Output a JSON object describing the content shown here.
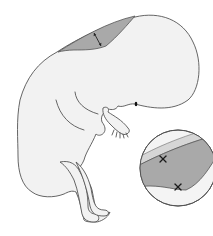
{
  "figure": {
    "colors": {
      "background": "#ffffff",
      "body_fill": "#f2f2f2",
      "outline": "#555555",
      "nuchal_translucency_fill": "#a9a9a9",
      "skin_band_fill": "#d6d6d6",
      "caliper_marker": "#1a1a1a"
    },
    "elements": {
      "nuchal_region": {
        "label": "nuchal-translucency",
        "measurement": "double-headed-arrow"
      },
      "inset": {
        "shape": "circle",
        "markers": [
          "caliper-cross-top",
          "caliper-cross-bottom"
        ]
      }
    }
  }
}
